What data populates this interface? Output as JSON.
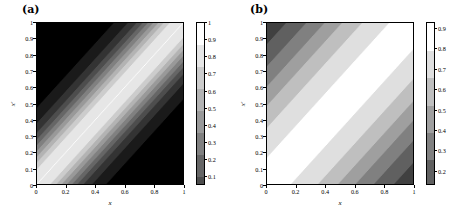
{
  "figure": {
    "background": "#ffffff",
    "panels": [
      {
        "tag": "(a)",
        "xlabel": "x",
        "ylabel": "x′",
        "xticks": [
          "0",
          "0.2",
          "0.4",
          "0.6",
          "0.8",
          "1"
        ],
        "xtick_values": [
          0,
          0.2,
          0.4,
          0.6,
          0.8,
          1
        ],
        "yticks": [
          "0",
          "0.1",
          "0.2",
          "0.3",
          "0.4",
          "0.5",
          "0.6",
          "0.7",
          "0.8",
          "0.9",
          "1"
        ],
        "ytick_values": [
          0,
          0.1,
          0.2,
          0.3,
          0.4,
          0.5,
          0.6,
          0.7,
          0.8,
          0.9,
          1
        ],
        "colorbar_ticks": [
          "0.1",
          "0.2",
          "0.3",
          "0.4",
          "0.5",
          "0.6",
          "0.7",
          "0.8",
          "0.9",
          "1"
        ],
        "colorbar_tick_values": [
          0.1,
          0.2,
          0.3,
          0.4,
          0.5,
          0.6,
          0.7,
          0.8,
          0.9,
          1.0
        ],
        "colorbar_min": 0.05,
        "colorbar_max": 1.0
      },
      {
        "tag": "(b)",
        "xlabel": "x",
        "ylabel": "x′",
        "xticks": [
          "0",
          "0.2",
          "0.4",
          "0.6",
          "0.8",
          "1"
        ],
        "xtick_values": [
          0,
          0.2,
          0.4,
          0.6,
          0.8,
          1
        ],
        "yticks": [
          "0",
          "0.1",
          "0.2",
          "0.3",
          "0.4",
          "0.5",
          "0.6",
          "0.7",
          "0.8",
          "0.9",
          "1"
        ],
        "ytick_values": [
          0,
          0.1,
          0.2,
          0.3,
          0.4,
          0.5,
          0.6,
          0.7,
          0.8,
          0.9,
          1
        ],
        "colorbar_ticks": [
          "0.2",
          "0.3",
          "0.4",
          "0.5",
          "0.6",
          "0.7",
          "0.8",
          "0.9"
        ],
        "colorbar_tick_values": [
          0.2,
          0.3,
          0.4,
          0.5,
          0.6,
          0.7,
          0.8,
          0.9
        ],
        "colorbar_min": 0.13,
        "colorbar_max": 0.93
      }
    ]
  },
  "chart_data": [
    {
      "type": "heatmap",
      "title": "(a)",
      "xlabel": "x",
      "ylabel": "x′",
      "xlim": [
        0,
        1
      ],
      "ylim": [
        0,
        1
      ],
      "zlim": [
        0.05,
        1.0
      ],
      "colormap": "gray",
      "grid": false,
      "legend": "colorbar-right",
      "description": "Grayscale contour map of a kernel K(x,x') that is maximal (white, value 1) along the diagonal x = x' and decays rapidly with |x - x'|, reaching near zero (black) in the upper-left and lower-right corners. Narrow banded contour levels.",
      "contour_levels": [
        0.1,
        0.2,
        0.3,
        0.4,
        0.5,
        0.6,
        0.7,
        0.8,
        0.9,
        1.0
      ],
      "decay_scale": 0.11,
      "x": [
        0,
        0.1,
        0.2,
        0.3,
        0.4,
        0.5,
        0.6,
        0.7,
        0.8,
        0.9,
        1
      ],
      "y": [
        0,
        0.1,
        0.2,
        0.3,
        0.4,
        0.5,
        0.6,
        0.7,
        0.8,
        0.9,
        1
      ],
      "z": [
        [
          1.0,
          0.64,
          0.17,
          0.03,
          0.01,
          0.01,
          0.01,
          0.01,
          0.01,
          0.01,
          0.01
        ],
        [
          0.64,
          1.0,
          0.64,
          0.17,
          0.03,
          0.01,
          0.01,
          0.01,
          0.01,
          0.01,
          0.01
        ],
        [
          0.17,
          0.64,
          1.0,
          0.64,
          0.17,
          0.03,
          0.01,
          0.01,
          0.01,
          0.01,
          0.01
        ],
        [
          0.03,
          0.17,
          0.64,
          1.0,
          0.64,
          0.17,
          0.03,
          0.01,
          0.01,
          0.01,
          0.01
        ],
        [
          0.01,
          0.03,
          0.17,
          0.64,
          1.0,
          0.64,
          0.17,
          0.03,
          0.01,
          0.01,
          0.01
        ],
        [
          0.01,
          0.01,
          0.03,
          0.17,
          0.64,
          1.0,
          0.64,
          0.17,
          0.03,
          0.01,
          0.01
        ],
        [
          0.01,
          0.01,
          0.01,
          0.03,
          0.17,
          0.64,
          1.0,
          0.64,
          0.17,
          0.03,
          0.01
        ],
        [
          0.01,
          0.01,
          0.01,
          0.01,
          0.03,
          0.17,
          0.64,
          1.0,
          0.64,
          0.17,
          0.03
        ],
        [
          0.01,
          0.01,
          0.01,
          0.01,
          0.01,
          0.03,
          0.17,
          0.64,
          1.0,
          0.64,
          0.17
        ],
        [
          0.01,
          0.01,
          0.01,
          0.01,
          0.01,
          0.01,
          0.03,
          0.17,
          0.64,
          1.0,
          0.64
        ],
        [
          0.01,
          0.01,
          0.01,
          0.01,
          0.01,
          0.01,
          0.01,
          0.03,
          0.17,
          0.64,
          1.0
        ]
      ]
    },
    {
      "type": "heatmap",
      "title": "(b)",
      "xlabel": "x",
      "ylabel": "x′",
      "xlim": [
        0,
        1
      ],
      "ylim": [
        0,
        1
      ],
      "zlim": [
        0.13,
        0.93
      ],
      "colormap": "gray",
      "grid": false,
      "legend": "colorbar-right",
      "description": "Grayscale contour map of a smoother kernel K(x,x') peaking (white, about 0.93) along the diagonal x = x' and decaying gradually with |x - x'|, reaching about 0.15 (dark) in the upper-left and lower-right corners. Broad banded contour levels.",
      "contour_levels": [
        0.2,
        0.3,
        0.4,
        0.5,
        0.6,
        0.7,
        0.8,
        0.9
      ],
      "decay_scale": 0.33,
      "x": [
        0,
        0.1,
        0.2,
        0.3,
        0.4,
        0.5,
        0.6,
        0.7,
        0.8,
        0.9,
        1
      ],
      "y": [
        0,
        0.1,
        0.2,
        0.3,
        0.4,
        0.5,
        0.6,
        0.7,
        0.8,
        0.9,
        1
      ],
      "z": [
        [
          0.93,
          0.89,
          0.78,
          0.64,
          0.5,
          0.38,
          0.29,
          0.23,
          0.18,
          0.16,
          0.14
        ],
        [
          0.89,
          0.93,
          0.89,
          0.78,
          0.64,
          0.5,
          0.38,
          0.29,
          0.23,
          0.18,
          0.16
        ],
        [
          0.78,
          0.89,
          0.93,
          0.89,
          0.78,
          0.64,
          0.5,
          0.38,
          0.29,
          0.23,
          0.18
        ],
        [
          0.64,
          0.78,
          0.89,
          0.93,
          0.89,
          0.78,
          0.64,
          0.5,
          0.38,
          0.29,
          0.23
        ],
        [
          0.5,
          0.64,
          0.78,
          0.89,
          0.93,
          0.89,
          0.78,
          0.64,
          0.5,
          0.38,
          0.29
        ],
        [
          0.38,
          0.5,
          0.64,
          0.78,
          0.89,
          0.93,
          0.89,
          0.78,
          0.64,
          0.5,
          0.38
        ],
        [
          0.29,
          0.38,
          0.5,
          0.64,
          0.78,
          0.89,
          0.93,
          0.89,
          0.78,
          0.64,
          0.5
        ],
        [
          0.23,
          0.29,
          0.38,
          0.5,
          0.64,
          0.78,
          0.89,
          0.93,
          0.89,
          0.78,
          0.64
        ],
        [
          0.18,
          0.23,
          0.29,
          0.38,
          0.5,
          0.64,
          0.78,
          0.89,
          0.93,
          0.89,
          0.78
        ],
        [
          0.16,
          0.18,
          0.23,
          0.29,
          0.38,
          0.5,
          0.64,
          0.78,
          0.89,
          0.93,
          0.89
        ],
        [
          0.14,
          0.16,
          0.18,
          0.23,
          0.29,
          0.38,
          0.5,
          0.64,
          0.78,
          0.89,
          0.93
        ]
      ]
    }
  ]
}
